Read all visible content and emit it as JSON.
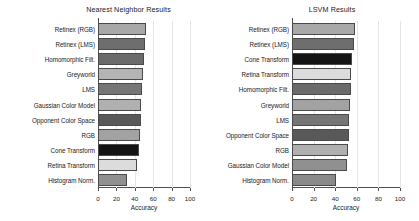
{
  "figure": {
    "background": "#ffffff",
    "axis_color": "#4d4d4d",
    "grid_color": "#e4e4e4"
  },
  "chart_data": [
    {
      "type": "bar",
      "orientation": "horizontal",
      "title": "Nearest Neighbor Results",
      "xlabel": "Accuracy",
      "ylabel": "",
      "xlim": [
        0,
        100
      ],
      "xticks": [
        0,
        20,
        40,
        60,
        80,
        100
      ],
      "xticklabels": [
        "0",
        "20",
        "40",
        "60",
        "80",
        "100"
      ],
      "grid": true,
      "legend": "none",
      "categories": [
        "Retinex (RGB)",
        "Retinex (LMS)",
        "Homomorphic Filt.",
        "Greyworld",
        "LMS",
        "Gaussian Color Model",
        "Opponent Color Space",
        "RGB",
        "Cone Transform",
        "Retina Transform",
        "Histogram Norm."
      ],
      "values": [
        52,
        51,
        50,
        49,
        48,
        47,
        47,
        46,
        45,
        42,
        31
      ],
      "bar_colors": [
        "#a8a8a8",
        "#6e6e6e",
        "#6b6b6b",
        "#b4b4b4",
        "#767676",
        "#b0b0b0",
        "#595959",
        "#a2a2a2",
        "#141414",
        "#dcdcdc",
        "#909090"
      ]
    },
    {
      "type": "bar",
      "orientation": "horizontal",
      "title": "LSVM Results",
      "xlabel": "Accuracy",
      "ylabel": "",
      "xlim": [
        0,
        100
      ],
      "xticks": [
        0,
        20,
        40,
        60,
        80,
        100
      ],
      "xticklabels": [
        "0",
        "20",
        "40",
        "60",
        "80",
        "100"
      ],
      "grid": true,
      "legend": "none",
      "categories": [
        "Retinex (RGB)",
        "Retinex (LMS)",
        "Cone Transform",
        "Retina Transform",
        "Homomorphic Filt.",
        "Greyworld",
        "LMS",
        "Opponent Color Space",
        "RGB",
        "Gaussian Color Model",
        "Histogram Norm."
      ],
      "values": [
        58,
        57,
        56,
        55,
        55,
        54,
        53,
        53,
        52,
        51,
        41
      ],
      "bar_colors": [
        "#a8a8a8",
        "#6e6e6e",
        "#141414",
        "#dcdcdc",
        "#6b6b6b",
        "#a2a2a2",
        "#767676",
        "#595959",
        "#b0b0b0",
        "#909090",
        "#8a8a8a"
      ]
    }
  ]
}
